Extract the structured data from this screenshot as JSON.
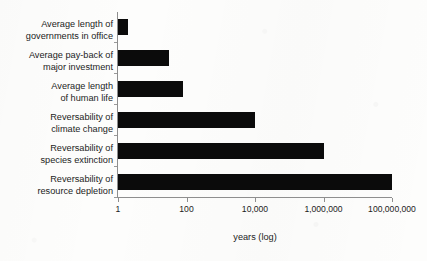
{
  "chart_data": {
    "type": "bar",
    "orientation": "horizontal",
    "title": "",
    "xlabel": "years (log)",
    "ylabel": "",
    "xscale": "log",
    "xlim": [
      1,
      100000000
    ],
    "grid": false,
    "legend": null,
    "bar_color": "#0b0b0b",
    "axis_color": "#8e8e8e",
    "categories": [
      "Average length of governments in office",
      "Average pay-back of major investment",
      "Average length of human life",
      "Reversability of climate change",
      "Reversability of species extinction",
      "Reversability of resource depletion"
    ],
    "category_lines": [
      [
        "Average length of",
        "governments in office"
      ],
      [
        "Average pay-back of",
        "major investment"
      ],
      [
        "Average length",
        "of human life"
      ],
      [
        "Reversability of",
        "climate change"
      ],
      [
        "Reversability of",
        "species extinction"
      ],
      [
        "Reversability of",
        "resource depletion"
      ]
    ],
    "values": [
      2,
      30,
      80,
      10000,
      1000000,
      100000000
    ],
    "xticks": [
      1,
      100,
      10000,
      1000000,
      100000000
    ],
    "xticklabels": [
      "1",
      "100",
      "10,000",
      "1,000,000",
      "100,000,000"
    ]
  }
}
